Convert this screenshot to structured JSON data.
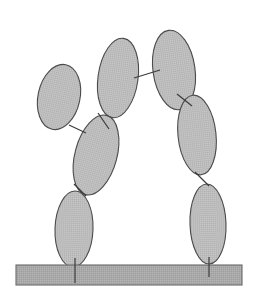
{
  "figure": {
    "title": "Articulated rigid-body chain of ellipses resting on a ground bar",
    "background_color": "#ffffff",
    "width": 255,
    "height": 296
  },
  "style": {
    "body_fill": "#b9b9b9",
    "body_stroke": "#4a4a4a",
    "ground_fill": "#a9a9a9",
    "ground_stroke": "#6a6a6a",
    "joint_stroke": "#3c3c3c",
    "texture_fill_light": "#c4c4c4",
    "texture_fill_dark": "#aeaeae"
  },
  "ground": {
    "name": "ground-bar",
    "x": 16,
    "y": 265,
    "width": 226,
    "height": 20,
    "fill": "#a9a9a9"
  },
  "bodies": [
    {
      "id": "left-upper-arm",
      "label": "Left upper limb",
      "cx": 59,
      "cy": 97,
      "rx": 21,
      "ry": 33,
      "rotation": 12
    },
    {
      "id": "left-forearm",
      "label": "Left forearm",
      "cx": 96,
      "cy": 155,
      "rx": 21,
      "ry": 41,
      "rotation": 15
    },
    {
      "id": "left-leg",
      "label": "Left leg",
      "cx": 74,
      "cy": 229,
      "rx": 19,
      "ry": 38,
      "rotation": 2
    },
    {
      "id": "torso-upper-left",
      "label": "Upper torso left",
      "cx": 118,
      "cy": 78,
      "rx": 20,
      "ry": 40,
      "rotation": 8
    },
    {
      "id": "torso-upper-right",
      "label": "Upper torso right",
      "cx": 174,
      "cy": 70,
      "rx": 21,
      "ry": 40,
      "rotation": -8
    },
    {
      "id": "right-forearm",
      "label": "Right forearm",
      "cx": 197,
      "cy": 135,
      "rx": 19,
      "ry": 40,
      "rotation": -6
    },
    {
      "id": "right-leg",
      "label": "Right leg",
      "cx": 208,
      "cy": 224,
      "rx": 18,
      "ry": 40,
      "rotation": -2
    }
  ],
  "joints": [
    {
      "id": "joint-left-shoulder",
      "label": "Left shoulder joint",
      "x1": 69,
      "y1": 125,
      "x2": 86,
      "y2": 133
    },
    {
      "id": "joint-left-elbow",
      "label": "Left elbow joint",
      "x1": 98,
      "y1": 113,
      "x2": 109,
      "y2": 129
    },
    {
      "id": "joint-left-hip",
      "label": "Left hip joint",
      "x1": 74,
      "y1": 184,
      "x2": 86,
      "y2": 196
    },
    {
      "id": "joint-spine",
      "label": "Central spine joint",
      "x1": 134,
      "y1": 78,
      "x2": 160,
      "y2": 70
    },
    {
      "id": "joint-right-shoulder",
      "label": "Right shoulder joint",
      "x1": 177,
      "y1": 94,
      "x2": 192,
      "y2": 106
    },
    {
      "id": "joint-right-elbow",
      "label": "Right elbow joint",
      "x1": 195,
      "y1": 172,
      "x2": 209,
      "y2": 186
    },
    {
      "id": "joint-left-foot-anchor",
      "label": "Left foot ground anchor",
      "x1": 75,
      "y1": 258,
      "x2": 75,
      "y2": 283
    },
    {
      "id": "joint-right-foot-anchor",
      "label": "Right foot ground anchor",
      "x1": 209,
      "y1": 257,
      "x2": 209,
      "y2": 277
    }
  ]
}
